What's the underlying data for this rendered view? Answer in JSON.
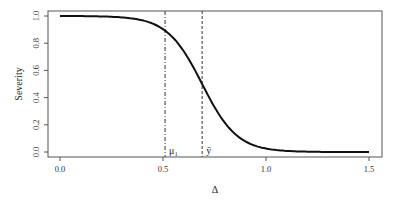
{
  "chart_data": {
    "type": "line",
    "title": "",
    "xlabel": "Δ",
    "ylabel": "Severity",
    "xlim": [
      -0.06,
      1.56
    ],
    "ylim": [
      -0.04,
      1.04
    ],
    "x_ticks": [
      "0.0",
      "0.5",
      "1.0",
      "1.5"
    ],
    "y_ticks": [
      "0.0",
      "0.2",
      "0.4",
      "0.6",
      "0.8",
      "1.0"
    ],
    "grid": false,
    "series": [
      {
        "name": "severity curve",
        "x": [
          0.0,
          0.1,
          0.2,
          0.3,
          0.35,
          0.4,
          0.45,
          0.5,
          0.55,
          0.6,
          0.65,
          0.69,
          0.75,
          0.8,
          0.85,
          0.9,
          0.95,
          1.0,
          1.1,
          1.2,
          1.3,
          1.4,
          1.5
        ],
        "values": [
          1.0,
          1.0,
          1.0,
          0.995,
          0.985,
          0.965,
          0.935,
          0.89,
          0.81,
          0.71,
          0.59,
          0.5,
          0.37,
          0.26,
          0.17,
          0.1,
          0.05,
          0.025,
          0.006,
          0.001,
          0.0,
          0.0,
          0.0
        ]
      }
    ],
    "annotations": [
      {
        "type": "vline",
        "x": 0.51,
        "style": "dashdot",
        "label": "μ₁"
      },
      {
        "type": "vline",
        "x": 0.69,
        "style": "dashed",
        "label": "ȳ"
      }
    ]
  }
}
